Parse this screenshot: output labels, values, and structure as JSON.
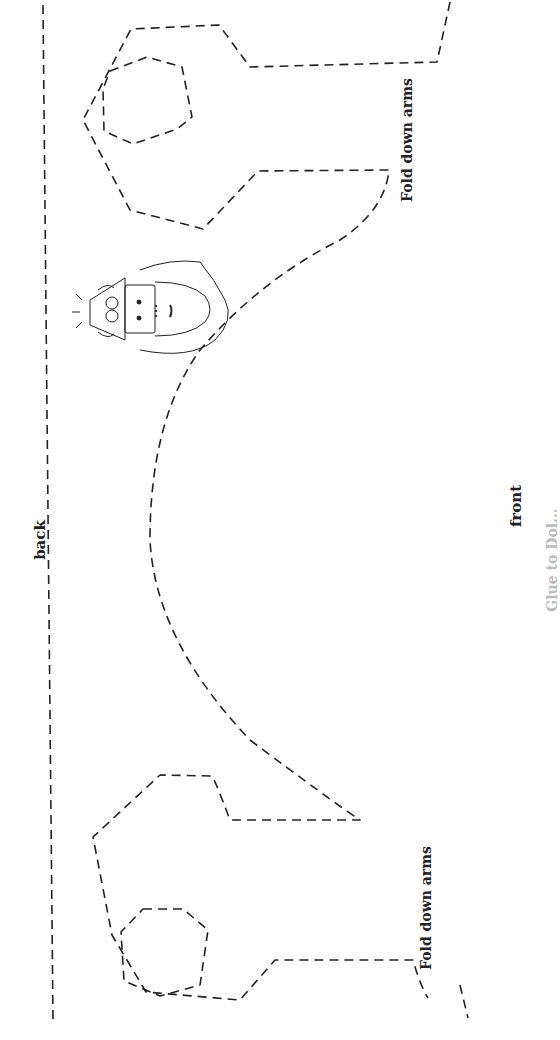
{
  "page": {
    "background": "#ffffff",
    "ink_color": "#222222"
  },
  "labels": {
    "back": "back",
    "front": "front",
    "fold_top": "Fold down arms",
    "fold_bottom": "Fold down arms",
    "clipped_right_edge": "Glue to Dol..."
  },
  "illustration": {
    "subject": "doll-face-with-helmet",
    "icon": "face-illustration-icon"
  }
}
